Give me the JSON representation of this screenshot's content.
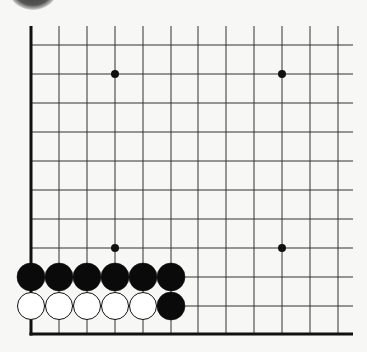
{
  "diagram": {
    "type": "go-board-fragment",
    "grid": {
      "columns_x": [
        31,
        59,
        87,
        115,
        143,
        171,
        198,
        226,
        254,
        282,
        310,
        338
      ],
      "rows_y": [
        45,
        74,
        103,
        132,
        161,
        190,
        219,
        248,
        277,
        306,
        334
      ],
      "top_y": 26,
      "right_x": 353,
      "left_edge_x": 31,
      "bottom_edge_y": 334,
      "line_color": "#333333",
      "edge_color": "#111111"
    },
    "hoshi": [
      {
        "col": 3,
        "row": 1
      },
      {
        "col": 9,
        "row": 1
      },
      {
        "col": 3,
        "row": 7
      },
      {
        "col": 9,
        "row": 7
      }
    ],
    "stones": [
      {
        "color": "black",
        "col": 0,
        "row": 8
      },
      {
        "color": "black",
        "col": 1,
        "row": 8
      },
      {
        "color": "black",
        "col": 2,
        "row": 8
      },
      {
        "color": "black",
        "col": 3,
        "row": 8
      },
      {
        "color": "black",
        "col": 4,
        "row": 8
      },
      {
        "color": "black",
        "col": 5,
        "row": 8
      },
      {
        "color": "white",
        "col": 0,
        "row": 9
      },
      {
        "color": "white",
        "col": 1,
        "row": 9
      },
      {
        "color": "white",
        "col": 2,
        "row": 9
      },
      {
        "color": "white",
        "col": 3,
        "row": 9
      },
      {
        "color": "white",
        "col": 4,
        "row": 9
      },
      {
        "color": "black",
        "col": 5,
        "row": 9
      }
    ],
    "stone_radius": 14
  }
}
